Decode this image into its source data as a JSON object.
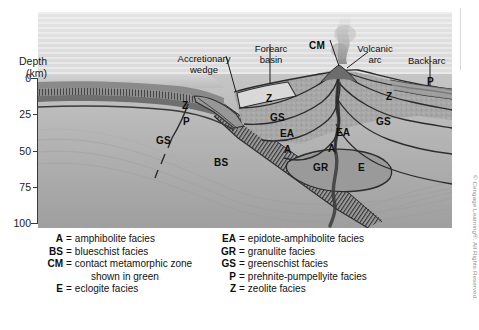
{
  "figure": {
    "type": "geologic-cross-section"
  },
  "axis": {
    "title_line1": "Depth",
    "title_line2": "(km)",
    "ticks": [
      "0",
      "25",
      "50",
      "75",
      "100"
    ],
    "min": 0,
    "max": 100,
    "unit": "km"
  },
  "annotations": [
    {
      "id": "accretionary-wedge",
      "line1": "Accretionary",
      "line2": "wedge"
    },
    {
      "id": "forearc-basin",
      "line1": "Forearc",
      "line2": "basin"
    },
    {
      "id": "cm-callout",
      "line1": "CM",
      "line2": ""
    },
    {
      "id": "volcanic-arc",
      "line1": "Volcanic",
      "line2": "arc"
    },
    {
      "id": "back-arc",
      "line1": "Back-arc",
      "line2": ""
    }
  ],
  "facies_labels": [
    {
      "id": "z-left",
      "text": "Z"
    },
    {
      "id": "p-left",
      "text": "P"
    },
    {
      "id": "gs-left",
      "text": "GS"
    },
    {
      "id": "bs-slab",
      "text": "BS"
    },
    {
      "id": "z-forearc",
      "text": "Z"
    },
    {
      "id": "gs-forearc",
      "text": "GS"
    },
    {
      "id": "ea-forearc",
      "text": "EA"
    },
    {
      "id": "a-forearc",
      "text": "A"
    },
    {
      "id": "gr-root",
      "text": "GR"
    },
    {
      "id": "ea-backarc",
      "text": "EA"
    },
    {
      "id": "a-backarc",
      "text": "A"
    },
    {
      "id": "e-backarc",
      "text": "E"
    },
    {
      "id": "z-backarc",
      "text": "Z"
    },
    {
      "id": "gs-backarc",
      "text": "GS"
    },
    {
      "id": "p-backarc",
      "text": "P"
    }
  ],
  "legend": {
    "left": [
      {
        "symbol": "A",
        "eq": "=",
        "text": "amphibolite facies"
      },
      {
        "symbol": "BS",
        "eq": "=",
        "text": "blueschist facies"
      },
      {
        "symbol": "CM",
        "eq": "=",
        "text": "contact metamorphic zone",
        "cont": "shown in green"
      },
      {
        "symbol": "E",
        "eq": "=",
        "text": "eclogite facies"
      }
    ],
    "right": [
      {
        "symbol": "EA",
        "eq": "=",
        "text": "epidote-amphibolite facies"
      },
      {
        "symbol": "GR",
        "eq": "=",
        "text": "granulite facies"
      },
      {
        "symbol": "GS",
        "eq": "=",
        "text": "greenschist facies"
      },
      {
        "symbol": "P",
        "eq": "=",
        "text": "prehnite-pumpellyite facies"
      },
      {
        "symbol": "Z",
        "eq": "=",
        "text": "zeolite facies"
      }
    ]
  },
  "credit": "© Cengage Learning®. All Rights Reserved.",
  "colors": {
    "ink": "#111111",
    "line": "#2a2a2a",
    "sky": "#dedede",
    "crust": "#8d8d8d",
    "mantle": "#b9b9b9",
    "arc": "#a3a3a3",
    "credit": "#8a8a8a"
  }
}
